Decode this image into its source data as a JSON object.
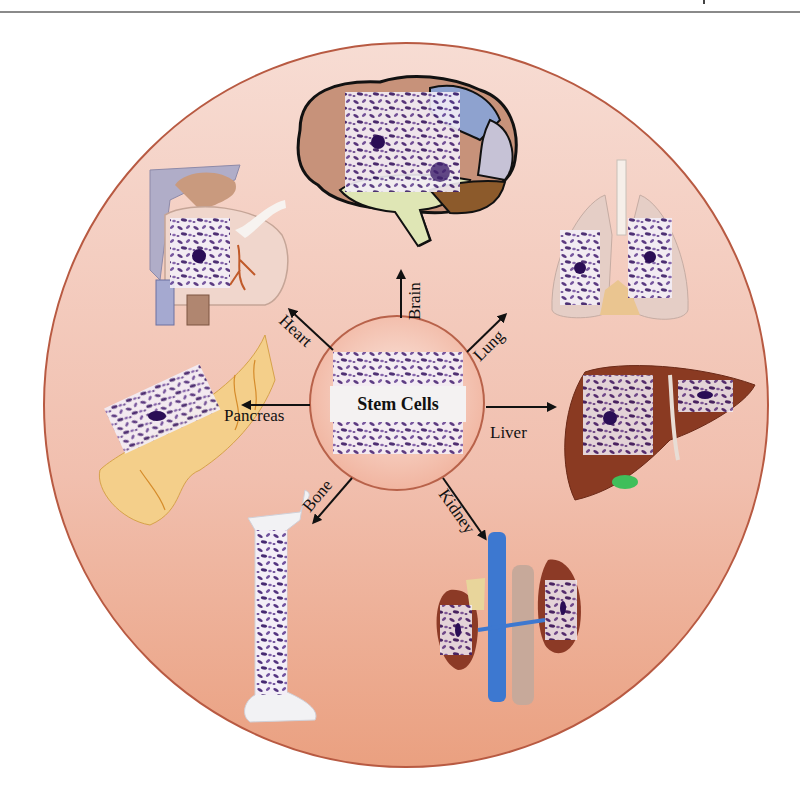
{
  "figure": {
    "center_label": "Stem Cells",
    "targets": [
      {
        "id": "brain",
        "label": "Brain"
      },
      {
        "id": "lung",
        "label": "Lung"
      },
      {
        "id": "liver",
        "label": "Liver"
      },
      {
        "id": "kidney",
        "label": "Kidney"
      },
      {
        "id": "bone",
        "label": "Bone"
      },
      {
        "id": "pancreas",
        "label": "Pancreas"
      },
      {
        "id": "heart",
        "label": "Heart"
      }
    ],
    "colors": {
      "outer_circle_top": "#f6d6cc",
      "outer_circle_bottom": "#eca48a",
      "outer_circle_border": "#b85a42",
      "cell_stain": "#4b2a7a",
      "arrow": "#111111"
    }
  }
}
